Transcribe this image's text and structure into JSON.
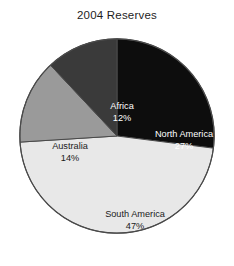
{
  "chart_data": {
    "type": "pie",
    "title": "2004 Reserves",
    "xlabel": "",
    "ylabel": "",
    "legend": "none",
    "grid": false,
    "start_angle_deg": 0,
    "direction": "clockwise",
    "categories": [
      "North America",
      "South America",
      "Australia",
      "Africa"
    ],
    "values": [
      27,
      47,
      14,
      12
    ],
    "unit": "%",
    "slices": [
      {
        "label": "North America",
        "value": 27,
        "value_text": "27%",
        "color": "#0d0d0d",
        "text_color": "#ffffff"
      },
      {
        "label": "South America",
        "value": 47,
        "value_text": "47%",
        "color": "#e8e8e8",
        "text_color": "#1a1a1a"
      },
      {
        "label": "Australia",
        "value": 14,
        "value_text": "14%",
        "color": "#9a9a9a",
        "text_color": "#1a1a1a"
      },
      {
        "label": "Africa",
        "value": 12,
        "value_text": "12%",
        "color": "#3a3a3a",
        "text_color": "#ffffff"
      }
    ],
    "outline_color": "#4a4a4a",
    "background": "#ffffff"
  }
}
